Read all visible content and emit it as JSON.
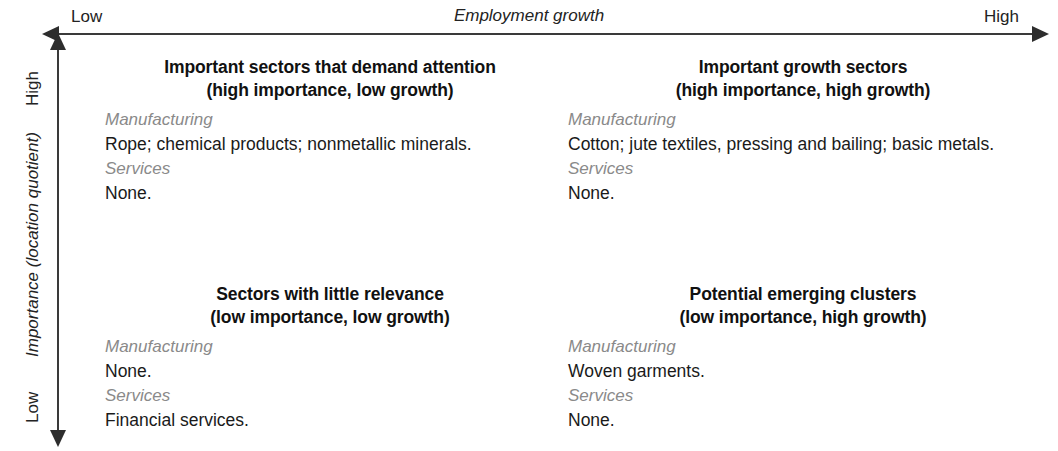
{
  "axes": {
    "x": {
      "title": "Employment growth",
      "low_label": "Low",
      "high_label": "High"
    },
    "y": {
      "title": "Importance (location quotient)",
      "low_label": "Low",
      "high_label": "High"
    }
  },
  "quadrants": {
    "top_left": {
      "heading_line1": "Important sectors that demand attention",
      "heading_line2": "(high importance, low growth)",
      "manufacturing_label": "Manufacturing",
      "manufacturing_value": "Rope; chemical products; nonmetallic minerals.",
      "services_label": "Services",
      "services_value": "None."
    },
    "top_right": {
      "heading_line1": "Important growth sectors",
      "heading_line2": "(high importance, high growth)",
      "manufacturing_label": "Manufacturing",
      "manufacturing_value": "Cotton; jute textiles, pressing and bailing; basic metals.",
      "services_label": "Services",
      "services_value": "None."
    },
    "bottom_left": {
      "heading_line1": "Sectors with little relevance",
      "heading_line2": "(low importance, low growth)",
      "manufacturing_label": "Manufacturing",
      "manufacturing_value": "None.",
      "services_label": "Services",
      "services_value": "Financial services."
    },
    "bottom_right": {
      "heading_line1": "Potential emerging clusters",
      "heading_line2": "(low importance, high growth)",
      "manufacturing_label": "Manufacturing",
      "manufacturing_value": "Woven garments.",
      "services_label": "Services",
      "services_value": "None."
    }
  },
  "chart_data": {
    "type": "table",
    "title": "",
    "xlabel": "Employment growth",
    "ylabel": "Importance (location quotient)",
    "x_tick_labels": [
      "Low",
      "High"
    ],
    "y_tick_labels": [
      "Low",
      "High"
    ],
    "grid": false,
    "legend": "none",
    "layout": "2x2 quadrant matrix",
    "categories": [
      "Manufacturing",
      "Services"
    ],
    "quadrants": [
      {
        "position": "top-left",
        "x": "low growth",
        "y": "high importance",
        "title": "Important sectors that demand attention",
        "subtitle": "(high importance, low growth)",
        "Manufacturing": "Rope; chemical products; nonmetallic minerals.",
        "Services": "None."
      },
      {
        "position": "top-right",
        "x": "high growth",
        "y": "high importance",
        "title": "Important growth sectors",
        "subtitle": "(high importance, high growth)",
        "Manufacturing": "Cotton; jute textiles, pressing and bailing; basic metals.",
        "Services": "None."
      },
      {
        "position": "bottom-left",
        "x": "low growth",
        "y": "low importance",
        "title": "Sectors with little relevance",
        "subtitle": "(low importance, low growth)",
        "Manufacturing": "None.",
        "Services": "Financial services."
      },
      {
        "position": "bottom-right",
        "x": "high growth",
        "y": "low importance",
        "title": "Potential emerging clusters",
        "subtitle": "(low importance, high growth)",
        "Manufacturing": "Woven garments.",
        "Services": "None."
      }
    ]
  }
}
